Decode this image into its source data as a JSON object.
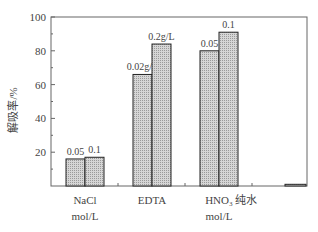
{
  "chart_data": {
    "type": "bar",
    "title": "",
    "xlabel": "",
    "ylabel": "解吸率/%",
    "ylim": [
      0,
      100
    ],
    "yticks": [
      20,
      40,
      60,
      80,
      100
    ],
    "grid": false,
    "legend": null,
    "groups": [
      {
        "category": "NaCl",
        "unit": "mol/L",
        "bars": [
          {
            "label": "0.05",
            "value": 16
          },
          {
            "label": "0.1",
            "value": 17
          }
        ]
      },
      {
        "category": "EDTA",
        "unit": "",
        "bars": [
          {
            "label": "0.02g/L",
            "value": 66
          },
          {
            "label": "0.2g/L",
            "value": 84
          }
        ]
      },
      {
        "category": "HNO3",
        "category_display": "HNO₃",
        "unit": "mol/L",
        "bars": [
          {
            "label": "0.05",
            "value": 80
          },
          {
            "label": "0.1",
            "value": 91
          }
        ]
      },
      {
        "category": "纯水",
        "unit": "",
        "bars": [
          {
            "label": "",
            "value": 1
          }
        ]
      }
    ]
  },
  "style": {
    "bar_fill": "#c8c8c8",
    "bar_stroke": "#222222",
    "axis_color": "#666666"
  }
}
